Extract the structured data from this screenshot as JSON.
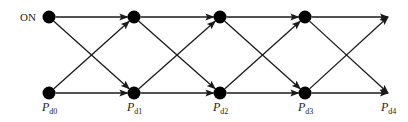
{
  "diagram": {
    "type": "trellis",
    "colors": {
      "stroke": "#1a1a1a",
      "node": "#000000",
      "text": "#222222",
      "background": "#ffffff"
    },
    "rows": {
      "top_y": 17,
      "bottom_y": 93
    },
    "columns_x": [
      49,
      134,
      220,
      305,
      388
    ],
    "start_label": "ON",
    "bottom_labels": [
      {
        "main": "P",
        "sub": "d0"
      },
      {
        "main": "P",
        "sub": "d1"
      },
      {
        "main": "P",
        "sub": "d2"
      },
      {
        "main": "P",
        "sub": "d3"
      },
      {
        "main": "P",
        "sub": "d4"
      }
    ],
    "nodes": [
      {
        "id": "top-0",
        "col": 0,
        "row": "top"
      },
      {
        "id": "bottom-0",
        "col": 0,
        "row": "bottom"
      },
      {
        "id": "top-1",
        "col": 1,
        "row": "top"
      },
      {
        "id": "bottom-1",
        "col": 1,
        "row": "bottom"
      },
      {
        "id": "top-2",
        "col": 2,
        "row": "top"
      },
      {
        "id": "bottom-2",
        "col": 2,
        "row": "bottom"
      },
      {
        "id": "top-3",
        "col": 3,
        "row": "top"
      },
      {
        "id": "bottom-3",
        "col": 3,
        "row": "bottom"
      }
    ],
    "edges": [
      {
        "from": [
          0,
          "top"
        ],
        "to": [
          1,
          "top"
        ]
      },
      {
        "from": [
          0,
          "top"
        ],
        "to": [
          1,
          "bottom"
        ]
      },
      {
        "from": [
          0,
          "bottom"
        ],
        "to": [
          1,
          "top"
        ]
      },
      {
        "from": [
          0,
          "bottom"
        ],
        "to": [
          1,
          "bottom"
        ]
      },
      {
        "from": [
          1,
          "top"
        ],
        "to": [
          2,
          "top"
        ]
      },
      {
        "from": [
          1,
          "top"
        ],
        "to": [
          2,
          "bottom"
        ]
      },
      {
        "from": [
          1,
          "bottom"
        ],
        "to": [
          2,
          "top"
        ]
      },
      {
        "from": [
          1,
          "bottom"
        ],
        "to": [
          2,
          "bottom"
        ]
      },
      {
        "from": [
          2,
          "top"
        ],
        "to": [
          3,
          "top"
        ]
      },
      {
        "from": [
          2,
          "top"
        ],
        "to": [
          3,
          "bottom"
        ]
      },
      {
        "from": [
          2,
          "bottom"
        ],
        "to": [
          3,
          "top"
        ]
      },
      {
        "from": [
          2,
          "bottom"
        ],
        "to": [
          3,
          "bottom"
        ]
      },
      {
        "from": [
          3,
          "top"
        ],
        "to": [
          4,
          "top"
        ]
      },
      {
        "from": [
          3,
          "top"
        ],
        "to": [
          4,
          "bottom"
        ]
      },
      {
        "from": [
          3,
          "bottom"
        ],
        "to": [
          4,
          "top"
        ]
      },
      {
        "from": [
          3,
          "bottom"
        ],
        "to": [
          4,
          "bottom"
        ]
      }
    ]
  }
}
